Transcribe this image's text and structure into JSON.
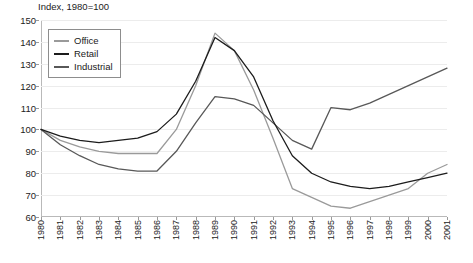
{
  "chart_data": {
    "type": "line",
    "title": "Index, 1980=100",
    "xlabel": "",
    "ylabel": "",
    "ylim": [
      60,
      150
    ],
    "ytick_step": 10,
    "yticks": [
      60,
      70,
      80,
      90,
      100,
      110,
      120,
      130,
      140,
      150
    ],
    "grid": true,
    "legend_position": "top-left",
    "categories": [
      "1980",
      "1981",
      "1982",
      "1983",
      "1984",
      "1985",
      "1986",
      "1987",
      "1988",
      "1989",
      "1990",
      "1991",
      "1992",
      "1993",
      "1994",
      "1995",
      "1996",
      "1997",
      "1998",
      "1999",
      "2000",
      "2001"
    ],
    "series": [
      {
        "name": "Office",
        "color": "#9a9a9a",
        "values": [
          100,
          95,
          92,
          90,
          89,
          89,
          89,
          100,
          120,
          144,
          136,
          118,
          96,
          73,
          69,
          65,
          64,
          67,
          70,
          73,
          80,
          84
        ]
      },
      {
        "name": "Retail",
        "color": "#1c1c1c",
        "values": [
          100,
          97,
          95,
          94,
          95,
          96,
          99,
          107,
          122,
          142,
          136,
          124,
          104,
          88,
          80,
          76,
          74,
          73,
          74,
          76,
          78,
          80
        ]
      },
      {
        "name": "Industrial",
        "color": "#585858",
        "values": [
          100,
          93,
          88,
          84,
          82,
          81,
          81,
          90,
          103,
          115,
          114,
          111,
          103,
          95,
          91,
          110,
          109,
          112,
          116,
          120,
          124,
          128
        ]
      }
    ],
    "series_overrides": {
      "Industrial": [
        100,
        93,
        88,
        84,
        82,
        81,
        81,
        90,
        103,
        115,
        114,
        111,
        103,
        95,
        91,
        110,
        109,
        112,
        116,
        120,
        124,
        128
      ]
    }
  },
  "legend": {
    "items": [
      {
        "label": "Office"
      },
      {
        "label": "Retail"
      },
      {
        "label": "Industrial"
      }
    ]
  }
}
